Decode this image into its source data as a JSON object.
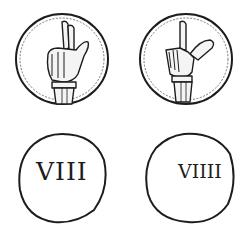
{
  "figure": {
    "ink_color": "#1d1d1d",
    "paper_color": "#ffffff",
    "tokens": [
      {
        "position": "left",
        "obverse": {
          "motif": "hand with two fingers raised, banded wrist"
        },
        "reverse": {
          "numeral": "VIII"
        }
      },
      {
        "position": "right",
        "obverse": {
          "motif": "hand with index finger raised and thumb extended, banded wrist"
        },
        "reverse": {
          "numeral": "VIIII"
        }
      }
    ]
  }
}
